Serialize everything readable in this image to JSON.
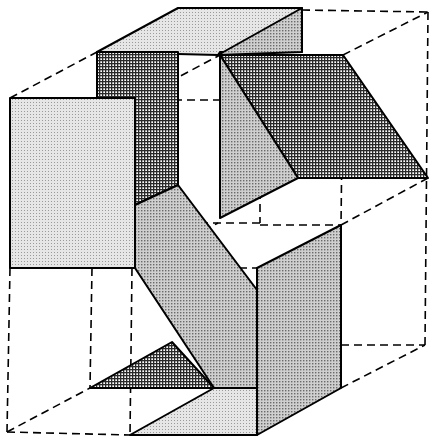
{
  "diagram": {
    "title": "",
    "width": 435,
    "height": 446,
    "colors": {
      "background": "#ffffff",
      "stroke": "#000000",
      "fill_light": "#d9d9d9",
      "fill_medium": "#bdbdbd",
      "fill_dark": "#7a7a7a"
    },
    "faces": [
      {
        "name": "top-box-top-face",
        "shade": "fill_light",
        "points": "97,52 178,8 302,8 302,52 220,52 218,55"
      },
      {
        "name": "top-box-right-face",
        "shade": "fill_medium",
        "points": "218,55 302,8 302,52"
      },
      {
        "name": "top-box-front-face",
        "shade": "fill_dark",
        "points": "97,52 178,52 178,185 135,205 135,98 97,98"
      },
      {
        "name": "left-panel-face",
        "shade": "fill_light",
        "points": "10,98 135,98 135,268 10,268"
      },
      {
        "name": "upper-right-parallelogram",
        "shade": "fill_dark",
        "points": "220,55 343,55 428,178 298,178"
      },
      {
        "name": "upper-right-triangle",
        "shade": "fill_medium",
        "points": "220,55 298,178 220,218"
      },
      {
        "name": "diagonal-slab",
        "shade": "fill_medium",
        "points": "135,205 178,185 257,290 257,388 214,388 135,268"
      },
      {
        "name": "right-vertical-panel",
        "shade": "fill_medium",
        "points": "257,268 341,225 341,388 257,435 257,388"
      },
      {
        "name": "lower-left-triangle",
        "shade": "fill_dark",
        "points": "90,388 172,342 214,388"
      },
      {
        "name": "bottom-face",
        "shade": "fill_light",
        "points": "130,435 214,388 257,388 257,435"
      }
    ],
    "dashed_edges": [
      {
        "name": "outer-top-left-diagonal",
        "x1": 10,
        "y1": 98,
        "x2": 97,
        "y2": 52
      },
      {
        "name": "outer-top-back-edge",
        "x1": 302,
        "y1": 10,
        "x2": 428,
        "y2": 12
      },
      {
        "name": "outer-right-vertical",
        "x1": 428,
        "y1": 12,
        "x2": 425,
        "y2": 345
      },
      {
        "name": "outer-top-right-diagonal",
        "x1": 343,
        "y1": 55,
        "x2": 428,
        "y2": 12
      },
      {
        "name": "inner-mid-horizontal-upper",
        "x1": 135,
        "y1": 100,
        "x2": 220,
        "y2": 100
      },
      {
        "name": "inner-diagonal-upper",
        "x1": 135,
        "y1": 100,
        "x2": 220,
        "y2": 55
      },
      {
        "name": "inner-horizontal-right-upper",
        "x1": 220,
        "y1": 100,
        "x2": 260,
        "y2": 100
      },
      {
        "name": "inner-diagonal-mid-right",
        "x1": 260,
        "y1": 100,
        "x2": 343,
        "y2": 55
      },
      {
        "name": "inner-vertical-260",
        "x1": 260,
        "y1": 100,
        "x2": 260,
        "y2": 223
      },
      {
        "name": "inner-vertical-343",
        "x1": 343,
        "y1": 55,
        "x2": 341,
        "y2": 225
      },
      {
        "name": "inner-diagonal-lower-right",
        "x1": 341,
        "y1": 225,
        "x2": 428,
        "y2": 178
      },
      {
        "name": "inner-horizontal-223",
        "x1": 135,
        "y1": 223,
        "x2": 260,
        "y2": 223
      },
      {
        "name": "inner-horizontal-225",
        "x1": 260,
        "y1": 225,
        "x2": 341,
        "y2": 225
      },
      {
        "name": "inner-horizontal-268",
        "x1": 135,
        "y1": 268,
        "x2": 257,
        "y2": 268
      },
      {
        "name": "inner-diagonal-middle",
        "x1": 135,
        "y1": 268,
        "x2": 218,
        "y2": 223
      },
      {
        "name": "outer-left-vertical",
        "x1": 10,
        "y1": 268,
        "x2": 7,
        "y2": 432
      },
      {
        "name": "inner-left-vertical-92",
        "x1": 92,
        "y1": 268,
        "x2": 90,
        "y2": 388
      },
      {
        "name": "inner-left-vertical-130",
        "x1": 132,
        "y1": 268,
        "x2": 130,
        "y2": 435
      },
      {
        "name": "outer-bottom-left-diagonal",
        "x1": 7,
        "y1": 432,
        "x2": 90,
        "y2": 388
      },
      {
        "name": "outer-bottom-front-edge",
        "x1": 7,
        "y1": 432,
        "x2": 130,
        "y2": 435
      },
      {
        "name": "outer-bottom-right-horizontal",
        "x1": 341,
        "y1": 345,
        "x2": 425,
        "y2": 345
      },
      {
        "name": "outer-bottom-right-diagonal",
        "x1": 341,
        "y1": 388,
        "x2": 425,
        "y2": 345
      }
    ]
  }
}
